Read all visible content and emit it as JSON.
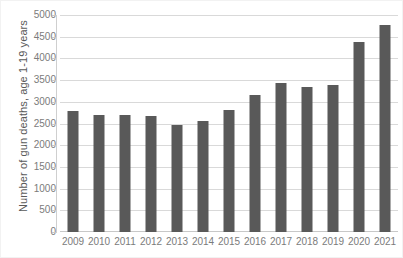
{
  "chart_data": {
    "type": "bar",
    "title": "",
    "xlabel": "",
    "ylabel": "Number of gun deaths, age 1-19 years",
    "categories": [
      "2009",
      "2010",
      "2011",
      "2012",
      "2013",
      "2014",
      "2015",
      "2016",
      "2017",
      "2018",
      "2019",
      "2020",
      "2021"
    ],
    "values": [
      2790,
      2700,
      2700,
      2680,
      2460,
      2550,
      2820,
      3160,
      3440,
      3350,
      3390,
      4380,
      4760
    ],
    "series": [
      {
        "name": "Number of gun deaths, age 1-19 years",
        "values": [
          2790,
          2700,
          2700,
          2680,
          2460,
          2550,
          2820,
          3160,
          3440,
          3350,
          3390,
          4380,
          4760
        ]
      }
    ],
    "ylim": [
      0,
      5000
    ],
    "y_ticks": [
      0,
      500,
      1000,
      1500,
      2000,
      2500,
      3000,
      3500,
      4000,
      4500,
      5000
    ],
    "y_tick_labels": [
      "0",
      "500",
      "1000",
      "1500",
      "2000",
      "2500",
      "3000",
      "3500",
      "4000",
      "4500",
      "5000"
    ],
    "grid": true,
    "grid_axis": "y",
    "legend": false,
    "legend_position": "none",
    "bar_color": "#595959",
    "gridline_color": "#d9d9d9",
    "axis_text_color": "#7b7b7b",
    "background_color": "#ffffff"
  },
  "axes": {
    "y_title": "Number of gun deaths, age 1-19 years"
  }
}
